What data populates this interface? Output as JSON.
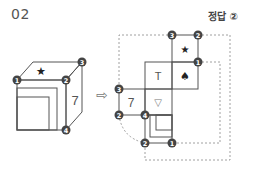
{
  "problem": {
    "number": "02",
    "answer_label": "정답 ②"
  },
  "cube": {
    "face_top_symbol": "★",
    "face_right_label": "7",
    "corners": [
      "1",
      "2",
      "3",
      "4"
    ]
  },
  "arrow": "⇨",
  "net": {
    "faces": [
      {
        "symbol": "★",
        "name": "star-face"
      },
      {
        "symbol": "T",
        "name": "t-face"
      },
      {
        "symbol": "♠",
        "name": "spade-face"
      },
      {
        "symbol": "7",
        "name": "seven-face"
      },
      {
        "symbol": "▽",
        "name": "triangle-face"
      }
    ],
    "badges": [
      "3",
      "2",
      "1",
      "3",
      "2",
      "4",
      "2",
      "1"
    ]
  },
  "colors": {
    "line": "#555555",
    "badge": "#444444",
    "dashed": "#888888"
  }
}
